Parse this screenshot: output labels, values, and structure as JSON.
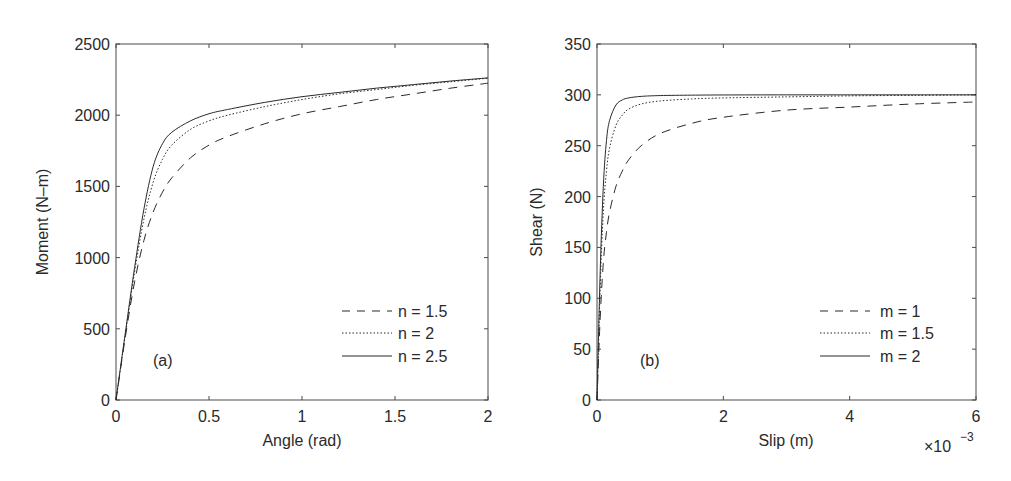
{
  "chart_data": [
    {
      "type": "line",
      "panel": "(a)",
      "title": "",
      "xlabel": "Angle (rad)",
      "ylabel": "Moment (N–m)",
      "xlim": [
        0,
        2
      ],
      "ylim": [
        0,
        2500
      ],
      "xticks": [
        0,
        0.5,
        1,
        1.5,
        2
      ],
      "xtick_labels": [
        "0",
        "0.5",
        "1",
        "1.5",
        "2"
      ],
      "yticks": [
        0,
        500,
        1000,
        1500,
        2000,
        2500
      ],
      "ytick_labels": [
        "0",
        "500",
        "1000",
        "1500",
        "2000",
        "2500"
      ],
      "grid": false,
      "legend_position": "lower right",
      "x": [
        0,
        0.05,
        0.1,
        0.15,
        0.2,
        0.25,
        0.3,
        0.4,
        0.5,
        0.6,
        0.8,
        1.0,
        1.2,
        1.4,
        1.6,
        1.8,
        2.0
      ],
      "series": [
        {
          "name": "n = 1.5",
          "style": "dashed",
          "values": [
            0,
            440,
            830,
            1120,
            1320,
            1460,
            1560,
            1700,
            1790,
            1850,
            1940,
            2010,
            2060,
            2110,
            2150,
            2190,
            2225
          ]
        },
        {
          "name": "n = 2",
          "style": "dotted",
          "values": [
            0,
            460,
            900,
            1270,
            1530,
            1690,
            1790,
            1900,
            1960,
            2000,
            2060,
            2110,
            2150,
            2180,
            2210,
            2235,
            2260
          ]
        },
        {
          "name": "n = 2.5",
          "style": "solid",
          "values": [
            0,
            470,
            930,
            1340,
            1640,
            1800,
            1880,
            1960,
            2010,
            2040,
            2090,
            2130,
            2160,
            2190,
            2215,
            2240,
            2262
          ]
        }
      ]
    },
    {
      "type": "line",
      "panel": "(b)",
      "title": "",
      "xlabel": "Slip (m)",
      "ylabel": "Shear (N)",
      "x_multiplier": "×10^-3",
      "xlim": [
        0,
        0.006
      ],
      "ylim": [
        0,
        350
      ],
      "xticks": [
        0,
        2,
        4,
        6
      ],
      "xtick_labels": [
        "0",
        "2",
        "4",
        "6"
      ],
      "yticks": [
        0,
        50,
        100,
        150,
        200,
        250,
        300,
        350
      ],
      "ytick_labels": [
        "0",
        "50",
        "100",
        "150",
        "200",
        "250",
        "300",
        "350"
      ],
      "grid": false,
      "legend_position": "lower right",
      "x_scaled": [
        0,
        0.05,
        0.1,
        0.15,
        0.2,
        0.3,
        0.4,
        0.5,
        0.7,
        1.0,
        1.5,
        2.0,
        3.0,
        4.0,
        5.0,
        6.0
      ],
      "series": [
        {
          "name": "m = 1",
          "style": "dashed",
          "values": [
            0,
            80,
            135,
            165,
            185,
            210,
            225,
            236,
            250,
            262,
            272,
            278,
            285,
            288,
            291,
            293
          ]
        },
        {
          "name": "m = 1.5",
          "style": "dotted",
          "values": [
            0,
            110,
            185,
            225,
            248,
            270,
            280,
            286,
            291,
            294,
            296,
            297,
            298,
            299,
            299.5,
            300
          ]
        },
        {
          "name": "m = 2",
          "style": "solid",
          "values": [
            0,
            125,
            210,
            255,
            275,
            290,
            295,
            297,
            298.5,
            299.3,
            299.7,
            299.9,
            300,
            300,
            300,
            300
          ]
        }
      ]
    }
  ],
  "panels": {
    "a": {
      "label": "(a)",
      "xlabel": "Angle (rad)",
      "ylabel": "Moment (N–m)",
      "xtick_labels": [
        "0",
        "0.5",
        "1",
        "1.5",
        "2"
      ],
      "ytick_labels": [
        "0",
        "500",
        "1000",
        "1500",
        "2000",
        "2500"
      ],
      "legend": [
        "n = 1.5",
        "n = 2",
        "n = 2.5"
      ]
    },
    "b": {
      "label": "(b)",
      "xlabel": "Slip (m)",
      "ylabel": "Shear (N)",
      "multiplier_base": "×10",
      "multiplier_exp": "−3",
      "xtick_labels": [
        "0",
        "2",
        "4",
        "6"
      ],
      "ytick_labels": [
        "0",
        "50",
        "100",
        "150",
        "200",
        "250",
        "300",
        "350"
      ],
      "legend": [
        "m = 1",
        "m = 1.5",
        "m = 2"
      ]
    }
  },
  "colors": {
    "line": "#2a2a2a",
    "frame": "#4a4a4a",
    "background": "#ffffff"
  }
}
